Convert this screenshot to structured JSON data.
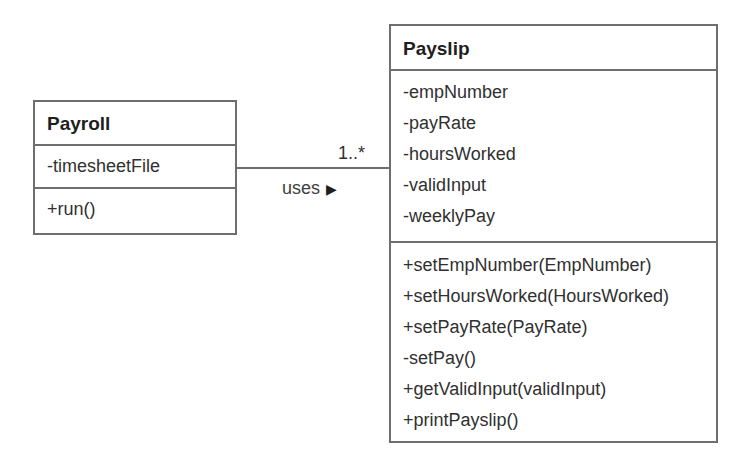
{
  "diagram": {
    "type": "UML class diagram",
    "classes": {
      "payroll": {
        "name": "Payroll",
        "attributes": [
          "-timesheetFile"
        ],
        "operations": [
          "+run()"
        ]
      },
      "payslip": {
        "name": "Payslip",
        "attributes": [
          "-empNumber",
          "-payRate",
          "-hoursWorked",
          "-validInput",
          "-weeklyPay"
        ],
        "operations": [
          "+setEmpNumber(EmpNumber)",
          "+setHoursWorked(HoursWorked)",
          "+setPayRate(PayRate)",
          "-setPay()",
          "+getValidInput(validInput)",
          "+printPayslip()"
        ]
      }
    },
    "association": {
      "from": "Payroll",
      "to": "Payslip",
      "label": "uses",
      "direction_icon": "▶",
      "multiplicity": "1..*"
    }
  }
}
